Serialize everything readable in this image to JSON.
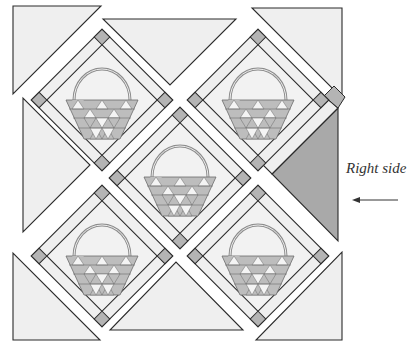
{
  "figure": {
    "type": "on-point quilt layout diagram",
    "label": "Right side",
    "arrow": "left-arrow pointing to right side setting triangle"
  },
  "colors": {
    "background": "#ffffff",
    "fabric_light": "#efefef",
    "fabric_medium": "#bdbdbd",
    "fabric_dark": "#a9a9a9",
    "outline": "#2b2b2b",
    "handle": "#8c8c8c",
    "label_text": "#333333"
  },
  "blocks": [
    {
      "id": "basket-top-left",
      "cx": 102,
      "cy": 100
    },
    {
      "id": "basket-top-right",
      "cx": 258,
      "cy": 100
    },
    {
      "id": "basket-center",
      "cx": 180,
      "cy": 178
    },
    {
      "id": "basket-bottom-left",
      "cx": 102,
      "cy": 256
    },
    {
      "id": "basket-bottom-right",
      "cx": 258,
      "cy": 256
    }
  ],
  "setting_triangles": [
    {
      "id": "corner-top-left",
      "points": "13,6 101,6 13,94"
    },
    {
      "id": "top-center",
      "points": "103,19 236,19 170,85"
    },
    {
      "id": "corner-top-right",
      "points": "252,8 342,8 342,98"
    },
    {
      "id": "left-center",
      "points": "23,98 23,232 90,165"
    },
    {
      "id": "right-center",
      "points": "338,108 338,241 272,174",
      "highlighted": true
    },
    {
      "id": "corner-bottom-left",
      "points": "13,253 13,340 100,340"
    },
    {
      "id": "bottom-center",
      "points": "110,330 243,330 176,262"
    },
    {
      "id": "corner-bottom-right",
      "points": "342,252 342,340 256,340"
    }
  ]
}
